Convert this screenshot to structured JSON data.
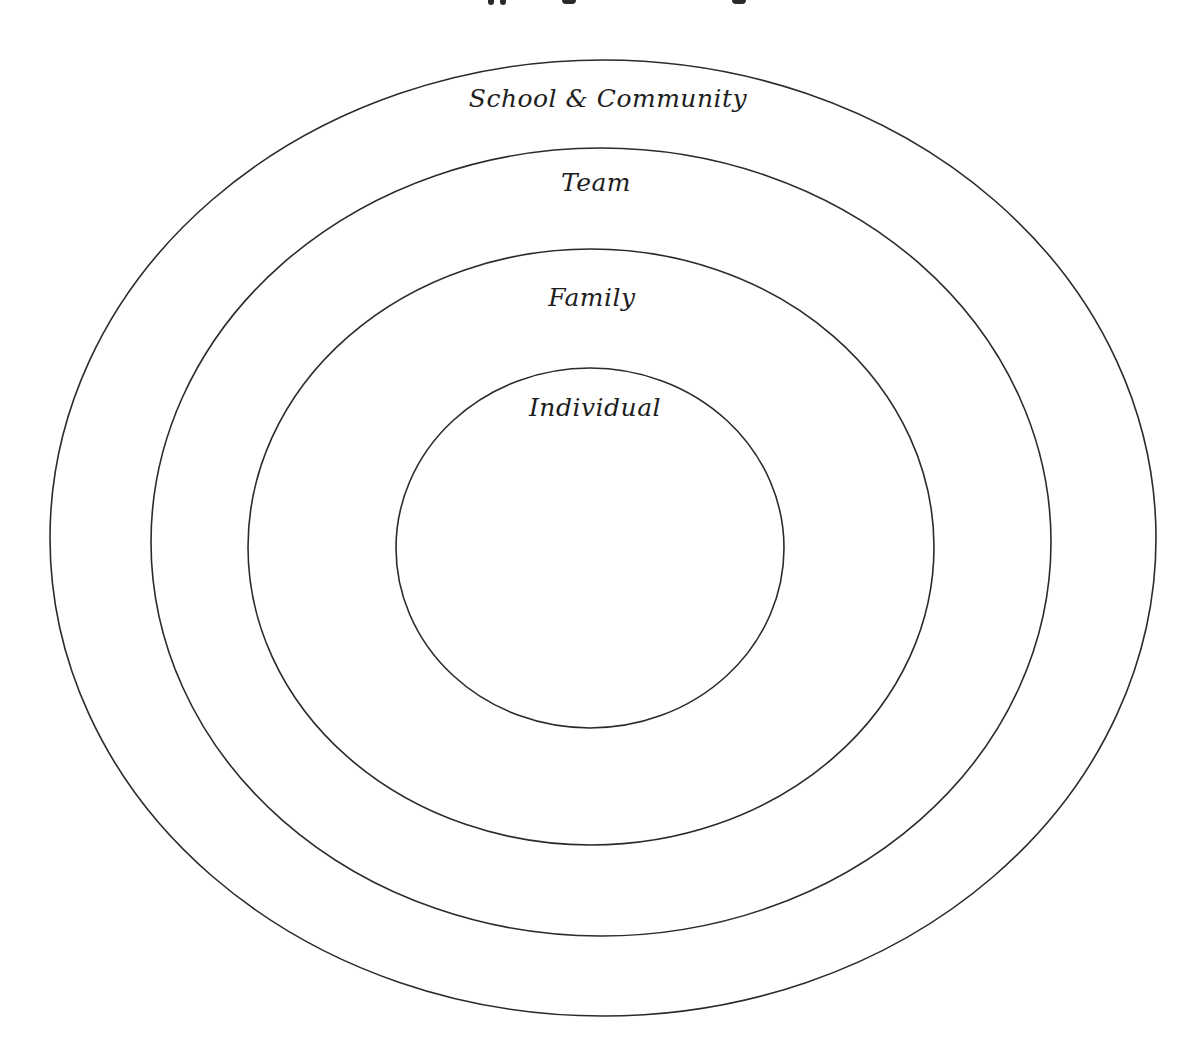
{
  "diagram": {
    "type": "concentric-ellipses",
    "title_clipped": true,
    "colors": {
      "stroke": "#2b2b2b",
      "text": "#1e1e1e",
      "background": "#ffffff"
    },
    "rings": [
      {
        "label": "School & Community",
        "cx": 603,
        "cy": 538,
        "rx": 553,
        "ry": 478,
        "label_x": 608,
        "label_y": 86
      },
      {
        "label": "Team",
        "cx": 601,
        "cy": 542,
        "rx": 450,
        "ry": 394,
        "label_x": 596,
        "label_y": 170
      },
      {
        "label": "Family",
        "cx": 591,
        "cy": 547,
        "rx": 343,
        "ry": 298,
        "label_x": 592,
        "label_y": 285
      },
      {
        "label": "Individual",
        "cx": 590,
        "cy": 548,
        "rx": 194,
        "ry": 180,
        "label_x": 595,
        "label_y": 395
      }
    ]
  }
}
